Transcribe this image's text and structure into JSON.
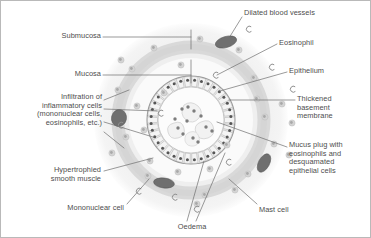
{
  "figure": {
    "background_color": "#ffffff",
    "border_color": "#b9b9b9",
    "text_color": "#4d4d4d",
    "leader_line_color": "#6b6b6b"
  },
  "palette": {
    "submucosa_fill": "#f0f0f0",
    "smooth_muscle_fill": "#d8d8d8",
    "mucosa_fill": "#f7f7f7",
    "epithelium_fill": "#ebebeb",
    "basement_membrane_dot": "#555555",
    "lumen_fill": "#fbfbfb",
    "blood_vessel_fill": "#6e6e6e",
    "inflammatory_cell_fill": "#cfcfcf",
    "mucus_cell_fill": "#bdbdbd"
  },
  "labels": [
    {
      "id": "submucosa",
      "name": "label-submucosa",
      "text": "Submucosa",
      "align": "right",
      "x": 14,
      "y": 31,
      "width": 86
    },
    {
      "id": "mucosa",
      "name": "label-mucosa",
      "text": "Mucosa",
      "align": "right",
      "x": 14,
      "y": 69,
      "width": 86
    },
    {
      "id": "infiltration",
      "name": "label-infiltration-of-inflammatory-cells",
      "text": "Infiltration of\ninflammatory cells\n(mononuclear cells,\neosinophils, etc.)",
      "align": "right",
      "x": 1,
      "y": 92,
      "width": 100
    },
    {
      "id": "hypertrophied-smooth-muscle",
      "name": "label-hypertrophied-smooth-muscle",
      "text": "Hypertrophied\nsmooth muscle",
      "align": "right",
      "x": 14,
      "y": 165,
      "width": 86
    },
    {
      "id": "mononuclear-cell",
      "name": "label-mononuclear-cell",
      "text": "Mononuclear cell",
      "align": "right",
      "x": 23,
      "y": 203,
      "width": 100
    },
    {
      "id": "oedema",
      "name": "label-oedema",
      "text": "Oedema",
      "align": "center",
      "x": 166,
      "y": 222,
      "width": 50
    },
    {
      "id": "mast-cell",
      "name": "label-mast-cell",
      "text": "Mast cell",
      "align": "left",
      "x": 258,
      "y": 205,
      "width": 60
    },
    {
      "id": "dilated-blood-vessels",
      "name": "label-dilated-blood-vessels",
      "text": "Dilated blood vessels",
      "align": "left",
      "x": 243,
      "y": 8,
      "width": 110
    },
    {
      "id": "eosinophil",
      "name": "label-eosinophil",
      "text": "Eosinophil",
      "align": "left",
      "x": 278,
      "y": 38,
      "width": 80
    },
    {
      "id": "epithelium",
      "name": "label-epithelium",
      "text": "Epithelium",
      "align": "left",
      "x": 288,
      "y": 66,
      "width": 80
    },
    {
      "id": "thickened-basement-membrane",
      "name": "label-thickened-basement-membrane",
      "text": "Thickened\nbasement\nmembrane",
      "align": "left",
      "x": 296,
      "y": 94,
      "width": 74
    },
    {
      "id": "mucus-plug",
      "name": "label-mucus-plug",
      "text": "Mucus plug with\neosinophils and\ndesquamated\nepithelial cells",
      "align": "left",
      "x": 288,
      "y": 140,
      "width": 84
    }
  ],
  "structures": {
    "submucosa_ring": "outer pale ring",
    "smooth_muscle_ring": "grey hypertrophied smooth muscle band",
    "mucosa_ring": "pale band inside smooth muscle",
    "epithelium_ring": "radial columnar epithelial cells",
    "basement_membrane": "ring of dark nuclei dots",
    "lumen": "central lumen occluded by mucus plug"
  }
}
